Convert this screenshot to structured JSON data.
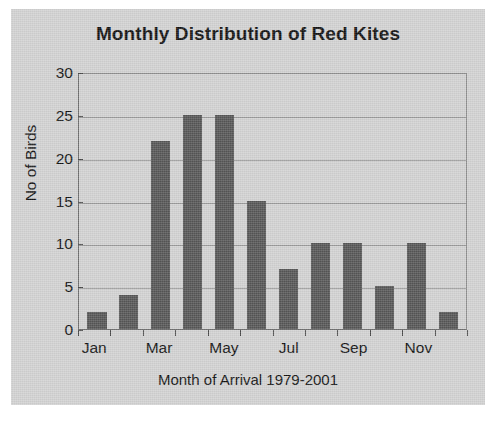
{
  "chart_data": {
    "type": "bar",
    "title": "Monthly Distribution of Red Kites",
    "xlabel": "Month of Arrival 1979-2001",
    "ylabel": "No of Birds",
    "categories": [
      "Jan",
      "Feb",
      "Mar",
      "Apr",
      "May",
      "Jun",
      "Jul",
      "Aug",
      "Sep",
      "Oct",
      "Nov",
      "Dec"
    ],
    "values": [
      2,
      4,
      22,
      25,
      25,
      15,
      7,
      10,
      10,
      5,
      10,
      2
    ],
    "visible_tick_labels": [
      "Jan",
      "Mar",
      "May",
      "Jul",
      "Sep",
      "Nov"
    ],
    "ylim": [
      0,
      30
    ],
    "yticks": [
      0,
      5,
      10,
      15,
      20,
      25,
      30
    ],
    "ytick_labels": [
      "0",
      "5",
      "10",
      "15",
      "20",
      "25",
      "30"
    ],
    "grid": true,
    "legend": false,
    "series_name": "No of Birds",
    "bar_color": "#565656",
    "background_color": "#d2d2d2",
    "gridline_color": "#9a9a9a",
    "axis_color": "#6f6f6f",
    "text_color": "#111111"
  }
}
